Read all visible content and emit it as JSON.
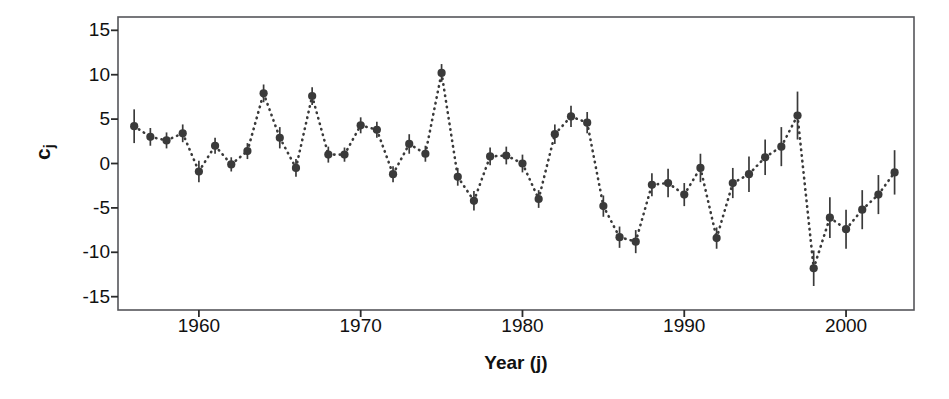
{
  "chart_data": {
    "type": "scatter",
    "title": "",
    "subtitle": "",
    "xlabel": "Year (j)",
    "ylabel": "c_j",
    "ylabel_base": "c",
    "ylabel_sub": "j",
    "xlim": [
      1955.0,
      2004.2
    ],
    "ylim": [
      -16.5,
      16.5
    ],
    "xticks": [
      1960,
      1970,
      1980,
      1990,
      2000
    ],
    "xticklabels": [
      "1960",
      "1970",
      "1980",
      "1990",
      "2000"
    ],
    "yticks": [
      15,
      10,
      5,
      0,
      -5,
      -10,
      -15
    ],
    "yticklabels": [
      "15",
      "10",
      "5",
      "0",
      "-5",
      "-10",
      "-15"
    ],
    "grid": false,
    "legend": null,
    "marker": "filled-circle",
    "marker_color": "#3a3a3a",
    "errorbar_color": "#3a3a3a",
    "connector_style": "dotted",
    "connector_color": "#3a3a3a",
    "series": [
      {
        "name": "c_j",
        "x": [
          1956,
          1957,
          1958,
          1959,
          1960,
          1961,
          1962,
          1963,
          1964,
          1965,
          1966,
          1967,
          1968,
          1969,
          1970,
          1971,
          1972,
          1973,
          1974,
          1975,
          1976,
          1977,
          1978,
          1979,
          1980,
          1981,
          1982,
          1983,
          1984,
          1985,
          1986,
          1987,
          1988,
          1989,
          1990,
          1991,
          1992,
          1993,
          1994,
          1995,
          1996,
          1997,
          1998,
          1999,
          2000,
          2001,
          2002,
          2003
        ],
        "values": [
          4.2,
          3.0,
          2.6,
          3.4,
          -0.9,
          2.0,
          -0.1,
          1.4,
          7.9,
          2.9,
          -0.5,
          7.6,
          1.0,
          1.0,
          4.3,
          3.8,
          -1.2,
          2.2,
          1.1,
          10.2,
          -1.5,
          -4.2,
          0.8,
          0.9,
          0.0,
          -4.0,
          3.3,
          5.3,
          4.6,
          -4.8,
          -8.3,
          -8.8,
          -2.4,
          -2.2,
          -3.5,
          -0.5,
          -8.4,
          -2.2,
          -1.2,
          0.7,
          1.9,
          5.4,
          -11.8,
          -6.1,
          -7.4,
          -5.2,
          -3.5,
          -1.0
        ],
        "errors": [
          1.9,
          1.0,
          0.9,
          1.0,
          1.2,
          0.9,
          0.8,
          0.9,
          1.0,
          1.2,
          1.0,
          1.0,
          0.9,
          0.8,
          0.9,
          0.9,
          0.9,
          1.1,
          0.9,
          1.0,
          1.0,
          1.1,
          1.0,
          1.0,
          1.0,
          1.0,
          1.1,
          1.2,
          1.2,
          1.2,
          1.2,
          1.3,
          1.3,
          1.6,
          1.3,
          1.6,
          1.2,
          1.7,
          2.0,
          2.0,
          2.2,
          2.7,
          2.0,
          2.3,
          2.2,
          2.2,
          2.2,
          2.5
        ]
      }
    ]
  }
}
